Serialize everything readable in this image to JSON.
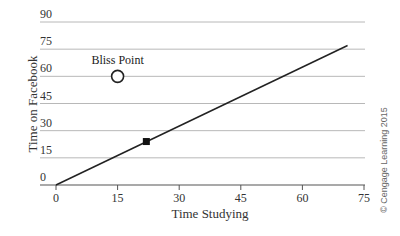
{
  "chart_data": {
    "type": "line",
    "title": "",
    "xlabel": "Time Studying",
    "ylabel": "Time on Facebook",
    "xlim": [
      0,
      75
    ],
    "ylim": [
      0,
      90
    ],
    "x_ticks": [
      "0",
      "15",
      "30",
      "45",
      "60",
      "75"
    ],
    "y_ticks": [
      "0",
      "15",
      "30",
      "45",
      "60",
      "75",
      "90"
    ],
    "grid": "horizontal",
    "series": [
      {
        "name": "budget line",
        "x": [
          0,
          71
        ],
        "y": [
          0,
          77
        ]
      }
    ],
    "points": [
      {
        "name": "Bliss Point",
        "x": 15,
        "y": 60,
        "marker": "open-circle",
        "label": "Bliss Point"
      },
      {
        "name": "current choice",
        "x": 22,
        "y": 24,
        "marker": "filled-square"
      }
    ],
    "credit": "© Cengage Learning 2015"
  }
}
